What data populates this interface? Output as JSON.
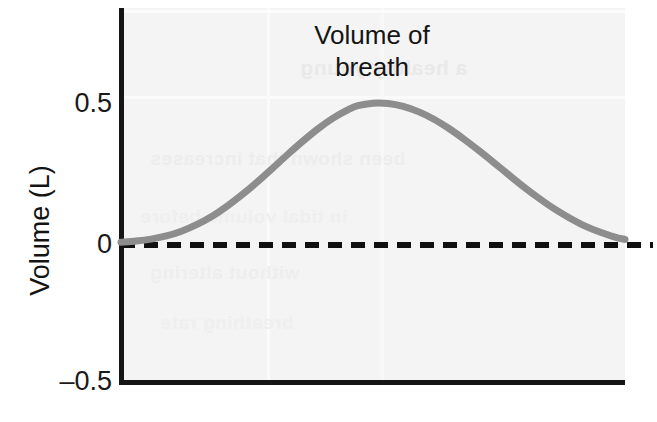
{
  "figure": {
    "title_lines": [
      "Volume of",
      "breath"
    ],
    "background_color": "#ffffff",
    "panel_color": "#f4f4f4"
  },
  "axes": {
    "y_axis_title": "Volume (L)",
    "y_tick_labels": [
      "0.5",
      "0",
      "–0.5"
    ],
    "x_tick_labels": [],
    "axis_color": "#151515"
  },
  "ghost": {
    "a": "a healthy young",
    "b": "been shown that increases",
    "c": "in tidal volume before",
    "d": "without altering",
    "e": "breathing rate"
  },
  "chart_data": {
    "type": "line",
    "title": "Volume of breath",
    "xlabel": "",
    "ylabel": "Volume (L)",
    "ylim": [
      -0.5,
      0.5
    ],
    "yticks": [
      -0.5,
      0,
      0.5
    ],
    "xlim": [
      0,
      1
    ],
    "xticks": [],
    "grid": false,
    "legend": "none",
    "series": [
      {
        "name": "Volume of breath",
        "color": "#8d8d8d",
        "linewidth": 7,
        "x": [
          0.0,
          0.03,
          0.06,
          0.09,
          0.12,
          0.15,
          0.18,
          0.21,
          0.24,
          0.27,
          0.3,
          0.33,
          0.36,
          0.39,
          0.42,
          0.45,
          0.47,
          0.5,
          0.53,
          0.56,
          0.59,
          0.62,
          0.65,
          0.68,
          0.71,
          0.74,
          0.77,
          0.8,
          0.83,
          0.86,
          0.89,
          0.92,
          0.95,
          0.98,
          1.0
        ],
        "y": [
          0.01,
          0.014,
          0.021,
          0.032,
          0.049,
          0.072,
          0.101,
          0.137,
          0.178,
          0.223,
          0.271,
          0.32,
          0.367,
          0.411,
          0.449,
          0.479,
          0.494,
          0.503,
          0.502,
          0.492,
          0.473,
          0.447,
          0.414,
          0.376,
          0.335,
          0.292,
          0.248,
          0.205,
          0.165,
          0.128,
          0.096,
          0.068,
          0.046,
          0.028,
          0.02
        ]
      },
      {
        "name": "zero baseline",
        "color": "#101010",
        "style": "dashed",
        "constant_y": 0.0
      }
    ],
    "annotations": [
      {
        "text": "Volume of breath",
        "x": 0.47,
        "y": 0.88,
        "role": "title"
      }
    ]
  }
}
